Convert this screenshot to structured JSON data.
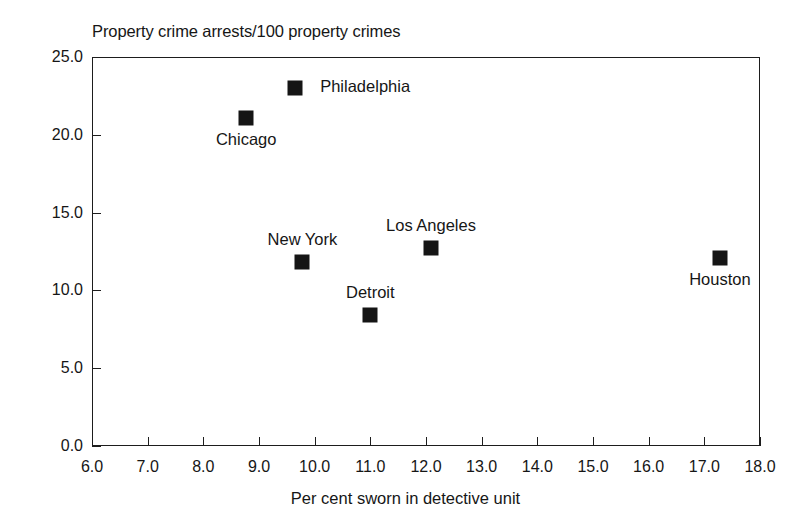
{
  "chart_data": {
    "type": "scatter",
    "title": "Property crime arrests/100 property crimes",
    "xlabel": "Per cent sworn in detective unit",
    "ylabel": "",
    "xlim": [
      6.0,
      18.0
    ],
    "ylim": [
      0.0,
      25.0
    ],
    "grid": false,
    "legend": "none",
    "xticks": [
      "6.0",
      "7.0",
      "8.0",
      "9.0",
      "10.0",
      "11.0",
      "12.0",
      "13.0",
      "14.0",
      "15.0",
      "16.0",
      "17.0",
      "18.0"
    ],
    "yticks": [
      "0.0",
      "5.0",
      "10.0",
      "15.0",
      "20.0",
      "25.0"
    ],
    "points": [
      {
        "label": "Philadelphia",
        "x": 9.65,
        "y": 23.0,
        "label_pos": "right"
      },
      {
        "label": "Chicago",
        "x": 8.77,
        "y": 21.1,
        "label_pos": "below"
      },
      {
        "label": "Los Angeles",
        "x": 12.09,
        "y": 12.7,
        "label_pos": "above"
      },
      {
        "label": "New York",
        "x": 9.78,
        "y": 11.8,
        "label_pos": "above"
      },
      {
        "label": "Houston",
        "x": 17.28,
        "y": 12.1,
        "label_pos": "below"
      },
      {
        "label": "Detroit",
        "x": 11.0,
        "y": 8.4,
        "label_pos": "above"
      }
    ],
    "marker_color": "#151515",
    "axis_color": "#1d1d1d",
    "background": "#ffffff"
  }
}
